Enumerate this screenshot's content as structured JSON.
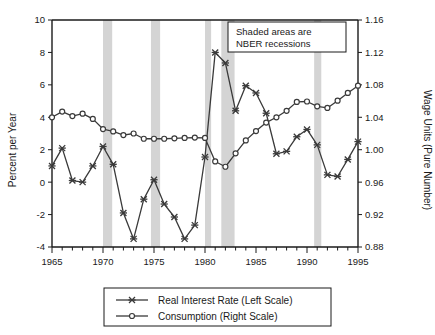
{
  "chart_data": {
    "type": "line",
    "title": "",
    "subtitle": "",
    "xlabel": "",
    "ylabel": "Percent per Year",
    "y2label": "Wage Units (Pure Number)",
    "xlim": [
      1965,
      1995
    ],
    "ylim": [
      -4,
      10
    ],
    "y2lim": [
      0.88,
      1.16
    ],
    "grid": false,
    "legend_position": "below-plot-center",
    "x_major_ticks": [
      1965,
      1970,
      1975,
      1980,
      1985,
      1990,
      1995
    ],
    "x_major_tick_labels": [
      "1965",
      "1970",
      "1975",
      "1980",
      "1985",
      "1990",
      "1995"
    ],
    "x_minor_tick_step": 1,
    "y_ticks": [
      -4,
      -2,
      0,
      2,
      4,
      6,
      8,
      10
    ],
    "y_tick_labels": [
      "-4",
      "-2",
      "0",
      "2",
      "4",
      "6",
      "8",
      "10"
    ],
    "y2_ticks": [
      0.88,
      0.92,
      0.96,
      1.0,
      1.04,
      1.08,
      1.12,
      1.16
    ],
    "y2_tick_labels": [
      "0.88",
      "0.92",
      "0.96",
      "1.00",
      "1.04",
      "1.08",
      "1.12",
      "1.16"
    ],
    "x": [
      1965,
      1966,
      1967,
      1968,
      1969,
      1970,
      1971,
      1972,
      1973,
      1974,
      1975,
      1976,
      1977,
      1978,
      1979,
      1980,
      1981,
      1982,
      1983,
      1984,
      1985,
      1986,
      1987,
      1988,
      1989,
      1990,
      1991,
      1992,
      1993,
      1994,
      1995
    ],
    "series": [
      {
        "name": "Real Interest Rate (Left Scale)",
        "axis": "left",
        "marker": "x",
        "color": "#3a3a3a",
        "values": [
          1.0,
          2.1,
          0.1,
          0.0,
          1.0,
          2.2,
          1.1,
          -1.9,
          -3.5,
          -1.05,
          0.15,
          -1.35,
          -2.15,
          -3.5,
          -2.65,
          1.55,
          8.0,
          7.35,
          4.4,
          5.95,
          5.5,
          4.25,
          1.75,
          1.9,
          2.8,
          3.25,
          2.3,
          0.45,
          0.35,
          1.4,
          2.5
        ]
      },
      {
        "name": "Consumption (Right Scale)",
        "axis": "right",
        "marker": "o",
        "color": "#3a3a3a",
        "values": [
          1.04,
          1.047,
          1.0415,
          1.0445,
          1.038,
          1.0255,
          1.0225,
          1.018,
          1.02,
          1.0135,
          1.0135,
          1.0135,
          1.014,
          1.0145,
          1.015,
          1.0145,
          0.9855,
          0.979,
          0.9955,
          1.0115,
          1.023,
          1.0335,
          1.04,
          1.048,
          1.059,
          1.0595,
          1.0535,
          1.0515,
          1.0605,
          1.07,
          1.079
        ]
      }
    ],
    "shaded_bands": {
      "label": "NBER recessions",
      "color": "#d4d4d4",
      "ranges": [
        [
          1970.0,
          1970.9
        ],
        [
          1974.7,
          1975.6
        ],
        [
          1980.0,
          1980.6
        ],
        [
          1981.6,
          1982.9
        ],
        [
          1990.7,
          1991.4
        ]
      ]
    },
    "annotations": [
      {
        "name": "shaded-areas-note",
        "line1": "Shaded areas  are",
        "line2": "NBER recessions",
        "boxed": true
      }
    ]
  },
  "legend": {
    "items": [
      {
        "label": "Real Interest Rate (Left Scale)",
        "marker": "x"
      },
      {
        "label": "Consumption (Right Scale)",
        "marker": "o"
      }
    ]
  },
  "axes": {
    "left_title": "Percent per Year",
    "right_title": "Wage Units (Pure Number)"
  }
}
